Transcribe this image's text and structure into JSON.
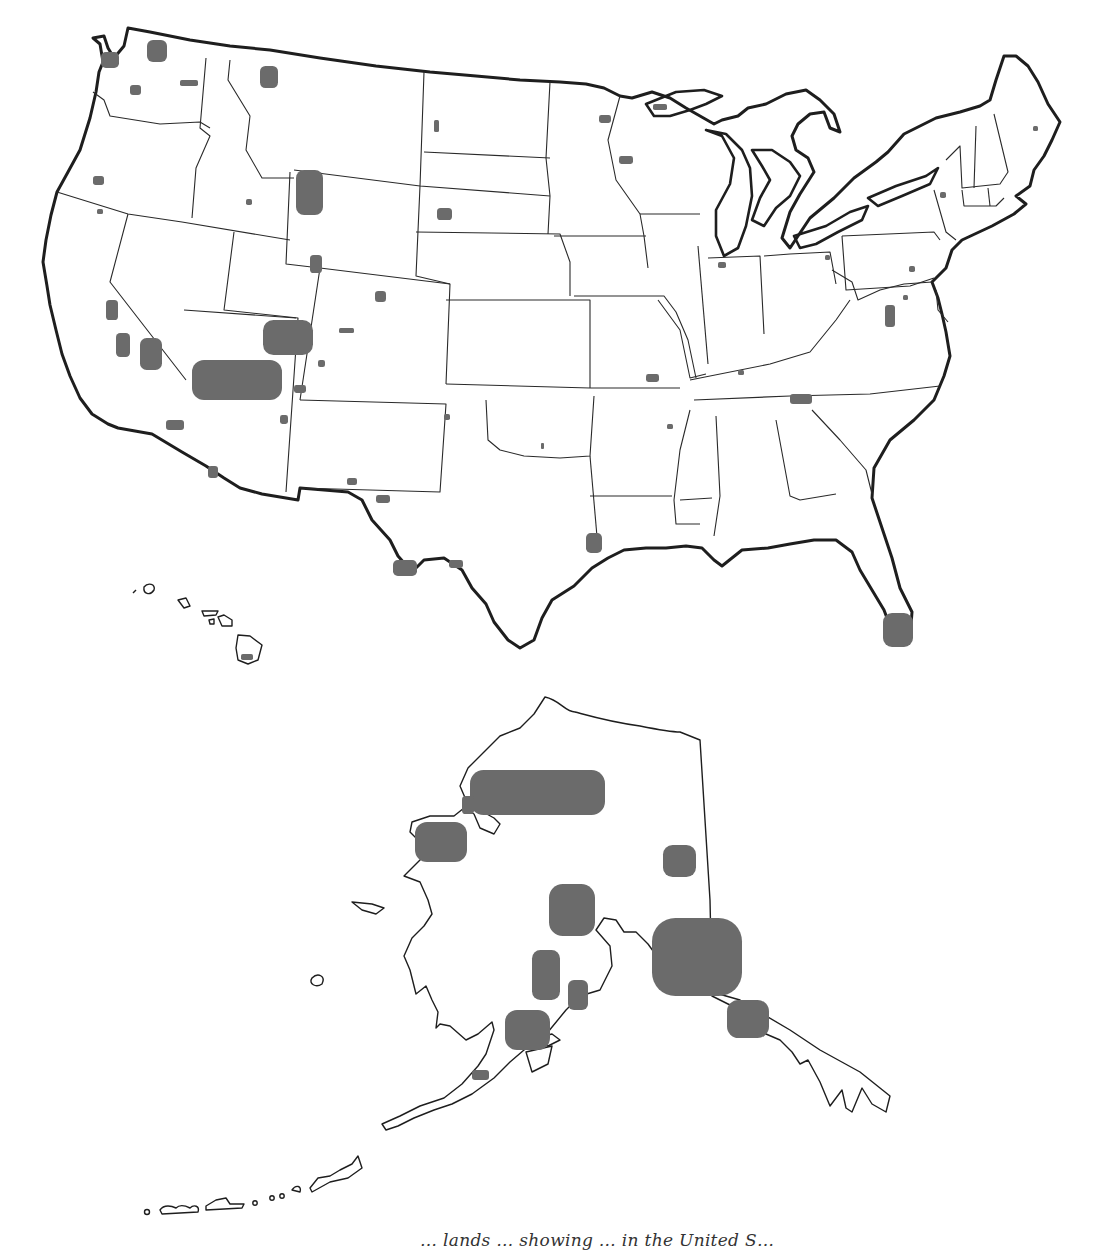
{
  "map": {
    "subject": "Protected lands in the United States",
    "park_fill_color": "#6b6b6b",
    "outline_color": "#1e1e1e",
    "background_color": "#ffffff",
    "insets": [
      "Hawaii",
      "Alaska"
    ],
    "caption": "… lands … showing … in the United S…",
    "regions": {
      "contiguous_us": {
        "label": "Contiguous United States",
        "parks": [
          {
            "name": "Olympic",
            "x": 101,
            "y": 52,
            "w": 18,
            "h": 16
          },
          {
            "name": "North Cascades",
            "x": 147,
            "y": 40,
            "w": 20,
            "h": 22
          },
          {
            "name": "Mount Rainier",
            "x": 130,
            "y": 85,
            "w": 11,
            "h": 10
          },
          {
            "name": "Lake Chelan",
            "x": 180,
            "y": 80,
            "w": 18,
            "h": 6
          },
          {
            "name": "Glacier",
            "x": 260,
            "y": 66,
            "w": 18,
            "h": 22
          },
          {
            "name": "Crater Lake",
            "x": 93,
            "y": 176,
            "w": 11,
            "h": 9
          },
          {
            "name": "Redwood",
            "x": 97,
            "y": 209,
            "w": 6,
            "h": 5
          },
          {
            "name": "Craters of the Moon",
            "x": 246,
            "y": 199,
            "w": 6,
            "h": 6
          },
          {
            "name": "Yellowstone / Grand Teton",
            "x": 296,
            "y": 170,
            "w": 27,
            "h": 45
          },
          {
            "name": "Theodore Roosevelt",
            "x": 434,
            "y": 120,
            "w": 5,
            "h": 12
          },
          {
            "name": "Wind Cave / Badlands",
            "x": 437,
            "y": 208,
            "w": 15,
            "h": 12
          },
          {
            "name": "Voyageurs",
            "x": 599,
            "y": 115,
            "w": 12,
            "h": 8
          },
          {
            "name": "Isle Royale",
            "x": 653,
            "y": 104,
            "w": 14,
            "h": 6
          },
          {
            "name": "Apostle Islands / Pictured Rocks",
            "x": 619,
            "y": 156,
            "w": 14,
            "h": 8
          },
          {
            "name": "Dinosaur",
            "x": 310,
            "y": 255,
            "w": 12,
            "h": 18
          },
          {
            "name": "Rocky Mountain",
            "x": 375,
            "y": 291,
            "w": 11,
            "h": 11
          },
          {
            "name": "Black Canyon",
            "x": 339,
            "y": 328,
            "w": 15,
            "h": 5
          },
          {
            "name": "Mesa Verde",
            "x": 318,
            "y": 360,
            "w": 7,
            "h": 7
          },
          {
            "name": "Canyonlands / Arches / Capitol Reef / Glen Canyon",
            "x": 263,
            "y": 320,
            "w": 50,
            "h": 35
          },
          {
            "name": "Grand Canyon / Lake Mead",
            "x": 192,
            "y": 360,
            "w": 90,
            "h": 40
          },
          {
            "name": "Petrified Forest",
            "x": 294,
            "y": 385,
            "w": 12,
            "h": 8
          },
          {
            "name": "Sunset Crater",
            "x": 280,
            "y": 415,
            "w": 8,
            "h": 9
          },
          {
            "name": "Yosemite",
            "x": 106,
            "y": 300,
            "w": 12,
            "h": 20
          },
          {
            "name": "Sequoia / Kings Canyon",
            "x": 116,
            "y": 333,
            "w": 14,
            "h": 24
          },
          {
            "name": "Death Valley",
            "x": 140,
            "y": 338,
            "w": 22,
            "h": 32
          },
          {
            "name": "Joshua Tree",
            "x": 166,
            "y": 420,
            "w": 18,
            "h": 10
          },
          {
            "name": "Organ Pipe Cactus",
            "x": 208,
            "y": 466,
            "w": 10,
            "h": 12
          },
          {
            "name": "Bandelier",
            "x": 444,
            "y": 414,
            "w": 6,
            "h": 6
          },
          {
            "name": "White Sands",
            "x": 347,
            "y": 478,
            "w": 10,
            "h": 7
          },
          {
            "name": "Guadalupe Mountains / Carlsbad",
            "x": 376,
            "y": 495,
            "w": 14,
            "h": 8
          },
          {
            "name": "Chickasaw",
            "x": 541,
            "y": 443,
            "w": 3,
            "h": 6
          },
          {
            "name": "Big Bend",
            "x": 393,
            "y": 560,
            "w": 24,
            "h": 16
          },
          {
            "name": "Amistad",
            "x": 449,
            "y": 560,
            "w": 14,
            "h": 8
          },
          {
            "name": "Big Thicket",
            "x": 586,
            "y": 533,
            "w": 16,
            "h": 20
          },
          {
            "name": "Ozark / Buffalo River",
            "x": 646,
            "y": 374,
            "w": 13,
            "h": 8
          },
          {
            "name": "Hot Springs",
            "x": 667,
            "y": 424,
            "w": 6,
            "h": 5
          },
          {
            "name": "Indiana Dunes",
            "x": 718,
            "y": 262,
            "w": 8,
            "h": 6
          },
          {
            "name": "Cuyahoga Valley",
            "x": 825,
            "y": 255,
            "w": 5,
            "h": 5
          },
          {
            "name": "Mammoth Cave",
            "x": 738,
            "y": 370,
            "w": 6,
            "h": 5
          },
          {
            "name": "Great Smoky Mountains",
            "x": 790,
            "y": 394,
            "w": 22,
            "h": 10
          },
          {
            "name": "Shenandoah",
            "x": 885,
            "y": 305,
            "w": 10,
            "h": 22
          },
          {
            "name": "Catoctin",
            "x": 903,
            "y": 295,
            "w": 5,
            "h": 5
          },
          {
            "name": "Delaware Water Gap",
            "x": 909,
            "y": 266,
            "w": 6,
            "h": 6
          },
          {
            "name": "Adirondack area",
            "x": 940,
            "y": 192,
            "w": 6,
            "h": 6
          },
          {
            "name": "Acadia",
            "x": 1033,
            "y": 126,
            "w": 5,
            "h": 5
          },
          {
            "name": "Everglades",
            "x": 883,
            "y": 613,
            "w": 30,
            "h": 34
          }
        ]
      },
      "hawaii": {
        "label": "Hawaii",
        "parks": [
          {
            "name": "Hawaii Volcanoes",
            "x": 241,
            "y": 654,
            "w": 12,
            "h": 6
          }
        ]
      },
      "alaska": {
        "label": "Alaska",
        "parks": [
          {
            "name": "Gates of the Arctic / Kobuk / Noatak",
            "x": 470,
            "y": 770,
            "w": 135,
            "h": 45
          },
          {
            "name": "Cape Krusenstern",
            "x": 462,
            "y": 796,
            "w": 12,
            "h": 18
          },
          {
            "name": "Bering Land Bridge",
            "x": 415,
            "y": 822,
            "w": 52,
            "h": 40
          },
          {
            "name": "Yukon-Charley Rivers",
            "x": 663,
            "y": 845,
            "w": 33,
            "h": 32
          },
          {
            "name": "Denali",
            "x": 549,
            "y": 884,
            "w": 46,
            "h": 52
          },
          {
            "name": "Wrangell-St. Elias",
            "x": 652,
            "y": 918,
            "w": 90,
            "h": 78
          },
          {
            "name": "Lake Clark",
            "x": 532,
            "y": 950,
            "w": 28,
            "h": 50
          },
          {
            "name": "Kenai Fjords",
            "x": 568,
            "y": 980,
            "w": 20,
            "h": 30
          },
          {
            "name": "Katmai",
            "x": 505,
            "y": 1010,
            "w": 45,
            "h": 40
          },
          {
            "name": "Glacier Bay",
            "x": 727,
            "y": 1000,
            "w": 42,
            "h": 38
          },
          {
            "name": "Aniakchak",
            "x": 472,
            "y": 1070,
            "w": 17,
            "h": 10
          }
        ]
      }
    }
  }
}
